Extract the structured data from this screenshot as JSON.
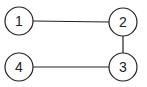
{
  "diagram": {
    "type": "graph",
    "nodes": [
      {
        "id": "1",
        "label": "1",
        "cx": 19,
        "cy": 21
      },
      {
        "id": "2",
        "label": "2",
        "cx": 123,
        "cy": 22
      },
      {
        "id": "3",
        "label": "3",
        "cx": 123,
        "cy": 67
      },
      {
        "id": "4",
        "label": "4",
        "cx": 19,
        "cy": 67
      }
    ],
    "edges": [
      {
        "from": "1",
        "to": "2"
      },
      {
        "from": "2",
        "to": "3"
      },
      {
        "from": "3",
        "to": "4"
      }
    ],
    "colors": {
      "stroke": "#222222",
      "fill": "#ffffff"
    }
  }
}
